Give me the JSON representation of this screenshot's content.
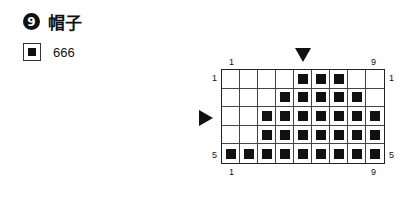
{
  "header": {
    "number": "9",
    "title": "帽子"
  },
  "legend": {
    "symbol": "filled-square",
    "label": "666"
  },
  "chart": {
    "cols": 9,
    "rows": 5,
    "top_labels": {
      "left": "1",
      "right": "9"
    },
    "bottom_labels": {
      "left": "1",
      "right": "9"
    },
    "left_labels": {
      "top": "1",
      "bottom": "5"
    },
    "right_labels": {
      "top": "1",
      "bottom": "5"
    },
    "column_marker": 5,
    "row_marker": 3,
    "pattern": [
      [
        0,
        0,
        0,
        0,
        1,
        1,
        1,
        0,
        0
      ],
      [
        0,
        0,
        0,
        1,
        1,
        1,
        1,
        1,
        0
      ],
      [
        0,
        0,
        1,
        1,
        1,
        1,
        1,
        1,
        1
      ],
      [
        0,
        0,
        1,
        1,
        1,
        1,
        1,
        1,
        1
      ],
      [
        1,
        1,
        1,
        1,
        1,
        1,
        1,
        1,
        1
      ]
    ]
  }
}
